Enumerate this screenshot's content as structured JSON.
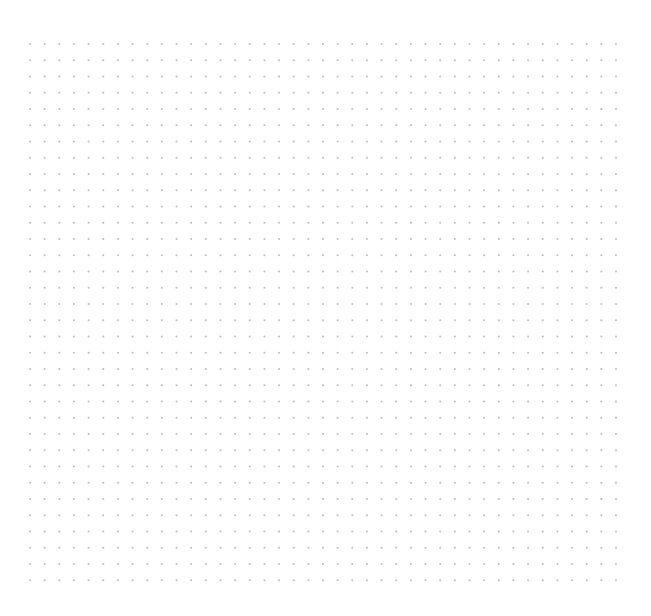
{
  "canvas": {
    "name": "dot-grid-canvas",
    "width": 651,
    "height": 616,
    "background_color": "#ffffff"
  },
  "grid": {
    "icon_name": "dot-marker-icon",
    "columns": 41,
    "rows": 34,
    "origin_x": 30,
    "origin_y": 44,
    "spacing_x": 14.65,
    "spacing_y": 16.25,
    "dot_color": "#b2b2ba",
    "dot_radius": 1.05,
    "dot_opacity": 0.85,
    "pattern_type": "regular-rectangular-lattice",
    "total_dots": 1394
  }
}
